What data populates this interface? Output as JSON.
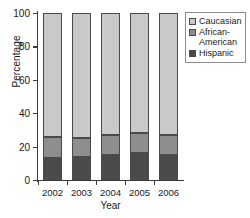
{
  "chart_data": {
    "type": "bar",
    "subtype": "stacked-bar-100",
    "title": "",
    "xlabel": "Year",
    "ylabel": "Percentage",
    "categories": [
      "2002",
      "2003",
      "2004",
      "2005",
      "2006"
    ],
    "ylim": [
      0,
      100
    ],
    "yticks": [
      0,
      20,
      40,
      60,
      80,
      100
    ],
    "ytick_labels": [
      "0",
      "20",
      "40",
      "60",
      "80",
      "100"
    ],
    "grid": false,
    "legend_position": "top-right",
    "stack_order_bottom_to_top": [
      "Hispanic",
      "African-American",
      "Caucasian"
    ],
    "series": [
      {
        "name": "Hispanic",
        "color": "#4a4a4a",
        "values": [
          13,
          14,
          15,
          16,
          15
        ]
      },
      {
        "name": "African-American",
        "color": "#8e8e8e",
        "values": [
          13,
          11,
          12,
          12,
          12
        ]
      },
      {
        "name": "Caucasian",
        "color": "#c9c9c9",
        "values": [
          74,
          75,
          73,
          72,
          73
        ]
      }
    ]
  },
  "legend": {
    "entries": [
      {
        "label": "Caucasian",
        "color": "#c9c9c9"
      },
      {
        "label": "African-\nAmerican",
        "color": "#8e8e8e"
      },
      {
        "label": "Hispanic",
        "color": "#4a4a4a"
      }
    ]
  }
}
